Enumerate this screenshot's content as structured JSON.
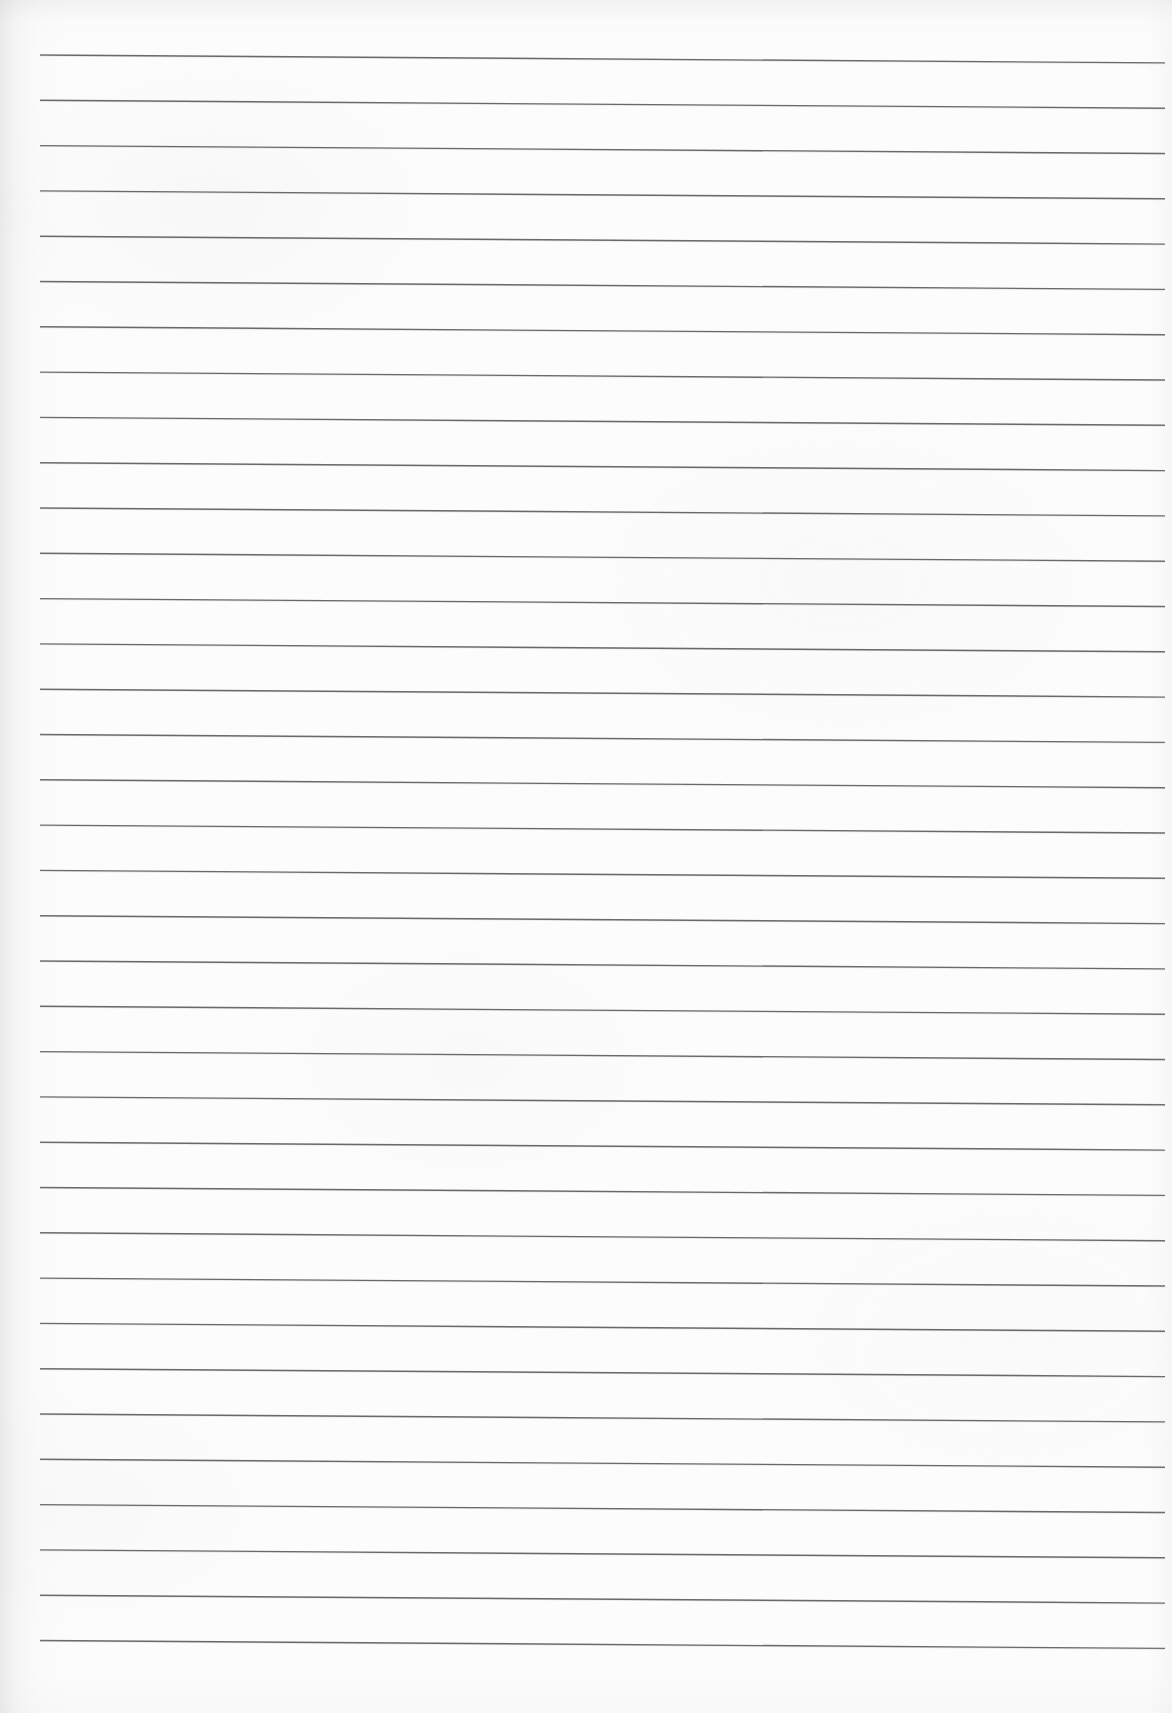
{
  "document": {
    "kind": "scanned-lined-notebook-page",
    "title": "Blank ruled notebook page",
    "text_content": "",
    "handwriting_present": "none",
    "page_width": 1172,
    "page_height": 1713,
    "paper_color": "#fcfcfc",
    "rule_color": "#5e5e60",
    "rule_count": 36,
    "rule_thickness": 1.4,
    "rule_spacing": 45.3,
    "first_rule_y_left": 55,
    "last_rule_y_left": 1648,
    "rule_x_start": 40,
    "rule_x_end": 1165,
    "rule_tilt_degrees": 0.4,
    "top_margin": 55,
    "bottom_margin": 65,
    "left_margin": 40,
    "right_margin": 7,
    "scan_shadow_color": "#a0a0a2",
    "notes": "No printed or handwritten text is present on the page; only horizontal ruling lines."
  },
  "rules": [
    {
      "index": 1,
      "y_left": 55.0,
      "y_right": 62.9
    },
    {
      "index": 2,
      "y_left": 100.3,
      "y_right": 108.2
    },
    {
      "index": 3,
      "y_left": 145.6,
      "y_right": 153.5
    },
    {
      "index": 4,
      "y_left": 190.9,
      "y_right": 198.8
    },
    {
      "index": 5,
      "y_left": 236.2,
      "y_right": 244.1
    },
    {
      "index": 6,
      "y_left": 281.5,
      "y_right": 289.4
    },
    {
      "index": 7,
      "y_left": 326.8,
      "y_right": 334.7
    },
    {
      "index": 8,
      "y_left": 372.1,
      "y_right": 380.0
    },
    {
      "index": 9,
      "y_left": 417.4,
      "y_right": 425.3
    },
    {
      "index": 10,
      "y_left": 462.7,
      "y_right": 470.6
    },
    {
      "index": 11,
      "y_left": 508.0,
      "y_right": 515.9
    },
    {
      "index": 12,
      "y_left": 553.3,
      "y_right": 561.2
    },
    {
      "index": 13,
      "y_left": 598.6,
      "y_right": 606.5
    },
    {
      "index": 14,
      "y_left": 643.9,
      "y_right": 651.8
    },
    {
      "index": 15,
      "y_left": 689.2,
      "y_right": 697.1
    },
    {
      "index": 16,
      "y_left": 734.5,
      "y_right": 742.4
    },
    {
      "index": 17,
      "y_left": 779.8,
      "y_right": 787.7
    },
    {
      "index": 18,
      "y_left": 825.1,
      "y_right": 833.0
    },
    {
      "index": 19,
      "y_left": 870.4,
      "y_right": 878.3
    },
    {
      "index": 20,
      "y_left": 915.7,
      "y_right": 923.6
    },
    {
      "index": 21,
      "y_left": 961.0,
      "y_right": 968.9
    },
    {
      "index": 22,
      "y_left": 1006.3,
      "y_right": 1014.2
    },
    {
      "index": 23,
      "y_left": 1051.6,
      "y_right": 1059.5
    },
    {
      "index": 24,
      "y_left": 1096.9,
      "y_right": 1104.8
    },
    {
      "index": 25,
      "y_left": 1142.2,
      "y_right": 1150.1
    },
    {
      "index": 26,
      "y_left": 1187.5,
      "y_right": 1195.4
    },
    {
      "index": 27,
      "y_left": 1232.8,
      "y_right": 1240.7
    },
    {
      "index": 28,
      "y_left": 1278.1,
      "y_right": 1286.0
    },
    {
      "index": 29,
      "y_left": 1323.4,
      "y_right": 1331.3
    },
    {
      "index": 30,
      "y_left": 1368.7,
      "y_right": 1376.6
    },
    {
      "index": 31,
      "y_left": 1414.0,
      "y_right": 1421.9
    },
    {
      "index": 32,
      "y_left": 1459.3,
      "y_right": 1467.2
    },
    {
      "index": 33,
      "y_left": 1504.6,
      "y_right": 1512.5
    },
    {
      "index": 34,
      "y_left": 1549.9,
      "y_right": 1557.8
    },
    {
      "index": 35,
      "y_left": 1595.2,
      "y_right": 1603.1
    },
    {
      "index": 36,
      "y_left": 1640.5,
      "y_right": 1648.4
    }
  ]
}
